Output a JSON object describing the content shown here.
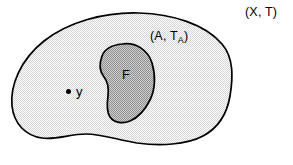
{
  "figure": {
    "name": "topology-subspace-diagram",
    "width": 293,
    "height": 165,
    "background": "#ffffff"
  },
  "labels": {
    "ambient_space": "(X, T)",
    "subspace_main": "(A, T",
    "subspace_subscript": "A",
    "subspace_close": ")",
    "closed_set": "F",
    "point": "y"
  },
  "colors": {
    "outline": "#000000",
    "ambient_background": "#ffffff",
    "subspace_fill": "#e3e3e3",
    "closed_set_fill": "#a8a8a8",
    "label_color": "#000000",
    "point_color": "#000000"
  },
  "shapes": {
    "subspace_blob": {
      "name": "A",
      "fill": "#e3e3e3",
      "stroke": "#000000",
      "stroke_width": 1.6,
      "path": "M 12,106 C 10,86 20,60 44,41 C 68,22 104,12 139,13 C 172,14 205,24 222,44 C 234,58 233,78 230,96 C 227,114 218,128 203,136 C 186,145 160,146 137,143 C 118,140 102,134 86,134 C 70,134 56,140 42,138 C 26,136 14,124 12,106 Z"
    },
    "closed_set_blob": {
      "name": "F",
      "fill": "#a8a8a8",
      "stroke": "#000000",
      "stroke_width": 1.6,
      "path": "M 122,44 C 136,42 148,50 152,63 C 156,76 155,90 150,100 C 145,110 137,118 130,121 C 123,124 114,123 110,117 C 106,111 107,103 108,96 C 109,88 108,82 104,77 C 100,72 99,64 102,56 C 105,48 112,45 122,44 Z"
    },
    "point_y": {
      "name": "y",
      "cx": 68.5,
      "cy": 91.5,
      "r": 2.6,
      "fill": "#000000"
    }
  }
}
